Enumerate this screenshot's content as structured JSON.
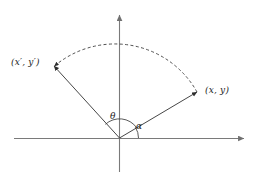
{
  "figure": {
    "background_color": "#ffffff",
    "line_color": "#3c3c3c",
    "axis_color": "#707070",
    "text_color": "#1a1a1a",
    "width": 258,
    "height": 180
  },
  "axes": {
    "x_axis": {
      "name": "horizontal-axis",
      "from": [
        14,
        138
      ],
      "to": [
        247,
        138
      ],
      "arrow_at_end": true
    },
    "y_axis": {
      "name": "vertical-axis",
      "from": [
        119,
        172
      ],
      "to": [
        119,
        12
      ],
      "arrow_at_end": true
    },
    "origin": [
      119,
      138
    ]
  },
  "rays": [
    {
      "name": "ray-to-original-point",
      "from": [
        119,
        138
      ],
      "to": [
        200,
        90
      ],
      "arrow_at_end": true,
      "style": "solid",
      "endpoint_label": "(x, y)"
    },
    {
      "name": "ray-to-rotated-point",
      "from": [
        119,
        138
      ],
      "to": [
        51,
        63
      ],
      "arrow_at_end": true,
      "style": "solid",
      "endpoint_label": "(x', y')"
    }
  ],
  "arc": {
    "name": "rotation-arc",
    "style": "dashed",
    "from": [
      200,
      90
    ],
    "to": [
      51,
      63
    ],
    "radius": 94,
    "arrow_at_end": true,
    "direction": "counterclockwise"
  },
  "angles": [
    {
      "name": "angle-theta",
      "symbol": "θ",
      "description": "rotation angle from (x, y) to (x', y')",
      "arc_radius": 20,
      "label_position": [
        110,
        112
      ]
    },
    {
      "name": "angle-alpha",
      "symbol": "α",
      "description": "angle of original point from positive x-axis",
      "arc_radius": 14,
      "label_position": [
        136,
        122
      ]
    }
  ],
  "labels": {
    "rotated_point": {
      "open_paren": "(",
      "x_symbol": "x′",
      "comma": ", ",
      "y_symbol": "y′",
      "close_paren": ")",
      "full": "(x′, y′)"
    },
    "original_point": {
      "open_paren": "(",
      "x_symbol": "x",
      "comma": ", ",
      "y_symbol": "y",
      "close_paren": ")",
      "full": "(x, y)"
    },
    "theta": "θ",
    "alpha": "α"
  }
}
